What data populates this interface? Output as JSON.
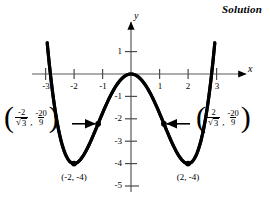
{
  "header": {
    "solution_label": "Solution"
  },
  "axes": {
    "x_name": "x",
    "y_name": "y",
    "x_ticks": [
      {
        "label": "-3",
        "value": -3
      },
      {
        "label": "-2",
        "value": -2
      },
      {
        "label": "-1",
        "value": -1
      },
      {
        "label": "1",
        "value": 1
      },
      {
        "label": "2",
        "value": 2
      },
      {
        "label": "3",
        "value": 3
      }
    ],
    "y_ticks": [
      {
        "label": "1",
        "value": 1
      },
      {
        "label": "-1",
        "value": -1
      },
      {
        "label": "-2",
        "value": -2
      },
      {
        "label": "-3",
        "value": -3
      },
      {
        "label": "-4",
        "value": -4
      },
      {
        "label": "-5",
        "value": -5
      }
    ]
  },
  "annotations": {
    "left_point": {
      "x_num": "-2",
      "x_den": "3",
      "x_den_prefix": "√",
      "y_num": "-20",
      "y_den": "9",
      "comma": ",",
      "open_paren": "(",
      "close_paren": ")"
    },
    "right_point": {
      "x_num": "2",
      "x_den": "3",
      "x_den_prefix": "√",
      "y_num": "-20",
      "y_den": "9",
      "comma": ",",
      "open_paren": "(",
      "close_paren": ")"
    },
    "left_minimum_label": "(-2, -4)",
    "right_minimum_label": "(2, -4)"
  },
  "chart_data": {
    "type": "line",
    "title": "",
    "xlabel": "x",
    "ylabel": "y",
    "xlim": [
      -3.3,
      3.3
    ],
    "ylim": [
      -5.2,
      1.6
    ],
    "grid": false,
    "legend": null,
    "function": "y = x^4/4 - 2x^2",
    "series": [
      {
        "name": "quartic",
        "x": [
          -3.0,
          -2.8,
          -2.6,
          -2.4,
          -2.2,
          -2.0,
          -1.8,
          -1.6,
          -1.4,
          -1.2,
          -1.0,
          -0.8,
          -0.6,
          -0.4,
          -0.2,
          0.0,
          0.2,
          0.4,
          0.6,
          0.8,
          1.0,
          1.2,
          1.4,
          1.6,
          1.8,
          2.0,
          2.2,
          2.4,
          2.6,
          2.8,
          3.0
        ],
        "y": [
          2.25,
          -0.31,
          -2.1,
          -3.23,
          -3.82,
          -4.0,
          -3.86,
          -3.52,
          -3.06,
          -2.36,
          -1.75,
          -1.18,
          -0.69,
          -0.31,
          -0.08,
          0.0,
          -0.08,
          -0.31,
          -0.69,
          -1.18,
          -1.75,
          -2.36,
          -3.06,
          -3.52,
          -3.86,
          -4.0,
          -3.82,
          -3.23,
          -2.1,
          -0.31,
          2.25
        ]
      }
    ],
    "marked_points": [
      {
        "label": "(-2, -4)",
        "x": -2,
        "y": -4,
        "kind": "minimum"
      },
      {
        "label": "(2, -4)",
        "x": 2,
        "y": -4,
        "kind": "minimum"
      },
      {
        "label": "(-2/√3, -20/9)",
        "x": -1.1547,
        "y": -2.2222,
        "kind": "inflection"
      },
      {
        "label": "(2/√3, -20/9)",
        "x": 1.1547,
        "y": -2.2222,
        "kind": "inflection"
      }
    ]
  }
}
